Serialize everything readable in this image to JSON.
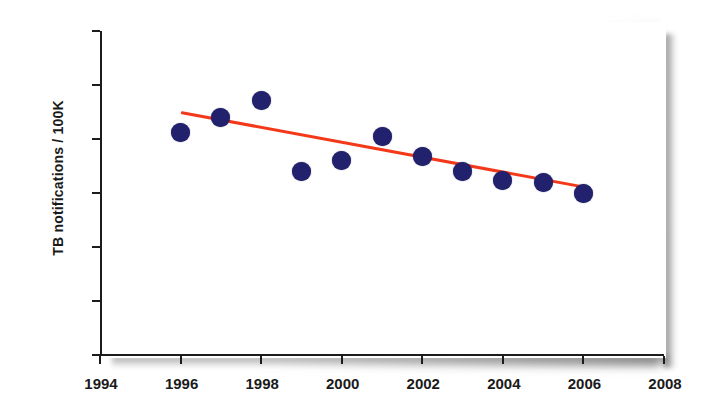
{
  "chart_data": {
    "type": "scatter",
    "title": "",
    "subtitle": "",
    "xlabel": "",
    "ylabel": "TB notifications / 100K",
    "xlim": [
      1994,
      2008
    ],
    "ylim": [
      0,
      150
    ],
    "grid": false,
    "legend": null,
    "x_ticks": [
      "1994",
      "1996",
      "1998",
      "2000",
      "2002",
      "2004",
      "2006",
      "2008"
    ],
    "y_ticks": [
      "0",
      "25",
      "50",
      "75",
      "100",
      "125",
      "150"
    ],
    "x": [
      1996,
      1997,
      1998,
      1999,
      2000,
      2001,
      2002,
      2003,
      2004,
      2005,
      2006
    ],
    "values": [
      103,
      110,
      118,
      85,
      90,
      101,
      92,
      85,
      81,
      80,
      75
    ],
    "marker_color": "#21216d",
    "series": [
      {
        "name": "TB notifications per 100K",
        "type": "scatter",
        "color": "#21216d",
        "points": [
          {
            "x": 1996,
            "y": 103
          },
          {
            "x": 1997,
            "y": 110
          },
          {
            "x": 1998,
            "y": 118
          },
          {
            "x": 1999,
            "y": 85
          },
          {
            "x": 2000,
            "y": 90
          },
          {
            "x": 2001,
            "y": 101
          },
          {
            "x": 2002,
            "y": 92
          },
          {
            "x": 2003,
            "y": 85
          },
          {
            "x": 2004,
            "y": 81
          },
          {
            "x": 2005,
            "y": 80
          },
          {
            "x": 2006,
            "y": 75
          }
        ]
      },
      {
        "name": "Linear trend",
        "type": "line",
        "color": "#f3391a",
        "points": [
          {
            "x": 1996,
            "y": 112.5
          },
          {
            "x": 2006,
            "y": 78
          }
        ]
      }
    ],
    "annotations": []
  },
  "colors": {
    "marker": "#21216d",
    "trend": "#f3391a",
    "axis": "#1c1c1c",
    "background": "#ffffff"
  }
}
